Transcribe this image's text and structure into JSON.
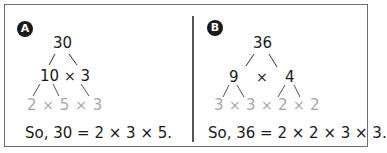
{
  "panels": [
    {
      "label": "A",
      "root": "30",
      "level1": {
        "left": "10",
        "op": "×",
        "right": "3"
      },
      "level2": [
        "2",
        "×",
        "5",
        "×",
        "3"
      ],
      "conclusion": "So, 30 = 2 × 3 × 5."
    },
    {
      "label": "B",
      "root": "36",
      "level1": {
        "left": "9",
        "op": "×",
        "right": "4"
      },
      "level2": [
        "3",
        "×",
        "3",
        "×",
        "2",
        "×",
        "2"
      ],
      "conclusion": "So, 36 = 2 × 2 × 3 × 3."
    }
  ],
  "colors": {
    "text": "#1a1a1a",
    "prime_factors": "#a8a8a8",
    "border": "#6e6e6e",
    "badge_bg": "#1a1a1a"
  }
}
